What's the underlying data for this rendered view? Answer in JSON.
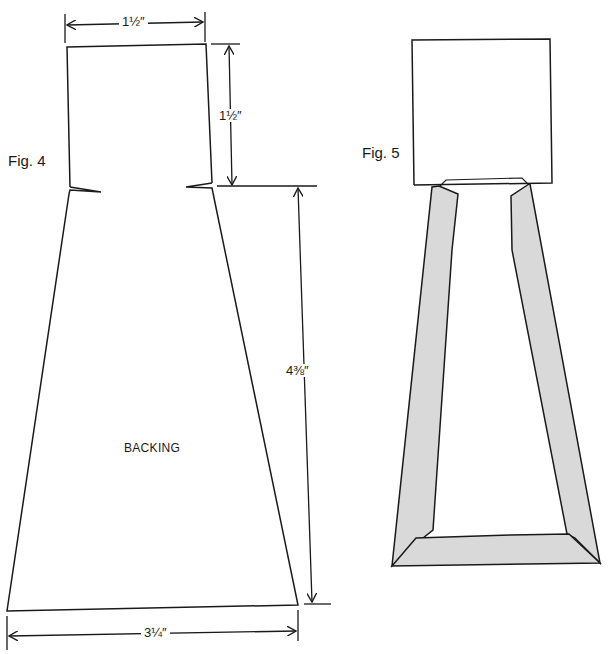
{
  "figures": [
    {
      "id": "fig4",
      "label": "Fig. 4",
      "part_label": "BACKING",
      "dimensions": {
        "top_width": "1½″",
        "top_height": "1½″",
        "trapezoid_height": "4⅜″",
        "bottom_width": "3¼″"
      }
    },
    {
      "id": "fig5",
      "label": "Fig. 5",
      "frame_fill": "#d9d9d9"
    }
  ],
  "colors": {
    "line": "#1a1a1a",
    "background": "#ffffff",
    "frame_fill": "#d9d9d9"
  }
}
